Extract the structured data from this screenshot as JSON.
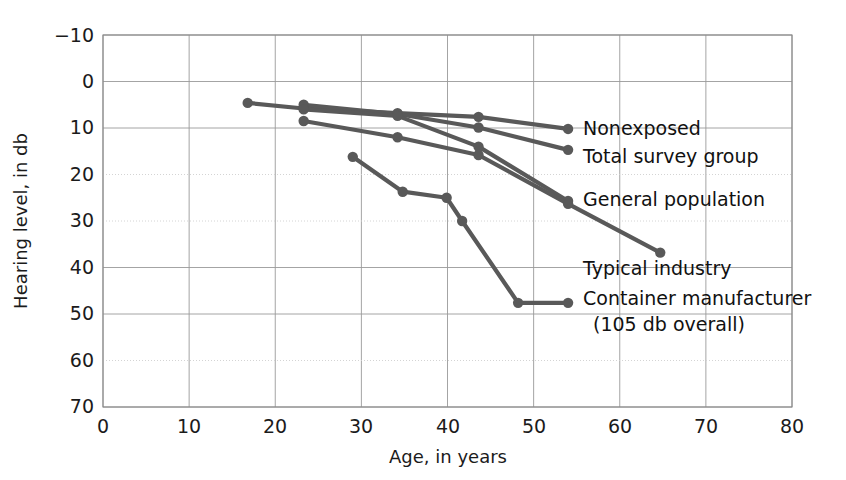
{
  "chart_data": {
    "type": "line",
    "title": "",
    "xlabel": "Age, in years",
    "ylabel": "Hearing level, in db",
    "xlim": [
      0,
      80
    ],
    "ylim": [
      -10,
      70
    ],
    "y_inverted": true,
    "grid": true,
    "legend_position": "inline-right-of-line-ends",
    "x_ticks": [
      "0",
      "10",
      "20",
      "30",
      "40",
      "50",
      "60",
      "70",
      "80"
    ],
    "x_tick_values": [
      0,
      10,
      20,
      30,
      40,
      50,
      60,
      70,
      80
    ],
    "y_ticks": [
      "−10",
      "0",
      "10",
      "20",
      "30",
      "40",
      "50",
      "60",
      "70"
    ],
    "y_tick_values": [
      -10,
      0,
      10,
      20,
      30,
      40,
      50,
      60,
      70
    ],
    "line_color": "#595959",
    "marker_color": "#595959",
    "series": [
      {
        "name": "Nonexposed",
        "label": "Nonexposed",
        "x": [
          16.8,
          23.3,
          34.2,
          43.6,
          54.0
        ],
        "values": [
          4.6,
          5.8,
          6.8,
          7.6,
          10.2
        ]
      },
      {
        "name": "Total survey group",
        "label": "Total survey group",
        "x": [
          23.3,
          34.2,
          43.6,
          54.0
        ],
        "values": [
          5.0,
          7.0,
          9.9,
          14.7
        ]
      },
      {
        "name": "General population",
        "label": "General population",
        "x": [
          23.3,
          34.2,
          43.6,
          54.0
        ],
        "values": [
          6.0,
          7.4,
          14.0,
          25.7
        ]
      },
      {
        "name": "Typical industry",
        "label": "Typical industry",
        "x": [
          23.3,
          34.2,
          43.6,
          54.0,
          64.7
        ],
        "values": [
          8.5,
          12.0,
          15.8,
          26.3,
          36.8
        ]
      },
      {
        "name": "Container manufacturer",
        "label": "Container manufacturer",
        "sublabel": "(105 db overall)",
        "x": [
          29.0,
          34.8,
          39.9,
          41.7,
          48.2,
          54.0
        ],
        "values": [
          16.2,
          23.7,
          25.0,
          30.0,
          47.6,
          47.6
        ]
      }
    ]
  },
  "labels": {
    "nonexposed": "Nonexposed",
    "total_survey_group": "Total survey group",
    "general_population": "General population",
    "typical_industry": "Typical industry",
    "container_manufacturer": "Container manufacturer",
    "container_sub": "(105 db overall)",
    "x_axis_title": "Age, in years",
    "y_axis_title": "Hearing level, in db"
  },
  "y_axis": {
    "t0": "−10",
    "t1": "0",
    "t2": "10",
    "t3": "20",
    "t4": "30",
    "t5": "40",
    "t6": "50",
    "t7": "60",
    "t8": "70"
  },
  "x_axis": {
    "t0": "0",
    "t1": "10",
    "t2": "20",
    "t3": "30",
    "t4": "40",
    "t5": "50",
    "t6": "60",
    "t7": "70",
    "t8": "80"
  },
  "colors": {
    "line": "#595959",
    "grid_major": "#9a9a9a",
    "grid_minor": "#cfcfcf",
    "frame": "#8a8a8a",
    "text": "#1b1b1b",
    "background": "#ffffff"
  }
}
